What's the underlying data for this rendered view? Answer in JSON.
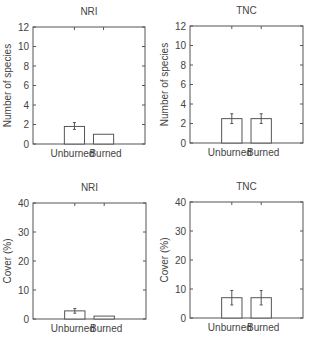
{
  "chart_data": [
    {
      "type": "bar",
      "title": "NRI",
      "xlabel": "",
      "ylabel": "Number of species",
      "categories": [
        "Unburned",
        "Burned"
      ],
      "values": [
        1.8,
        1.0
      ],
      "error_low": [
        1.5,
        null
      ],
      "error_high": [
        2.2,
        null
      ],
      "ylim": [
        0,
        12
      ],
      "yticks": [
        0,
        2,
        4,
        6,
        8,
        10,
        12
      ],
      "grid": false
    },
    {
      "type": "bar",
      "title": "TNC",
      "xlabel": "",
      "ylabel": "Number of species",
      "categories": [
        "Unburned",
        "Burned"
      ],
      "values": [
        2.5,
        2.5
      ],
      "error_low": [
        2.0,
        2.0
      ],
      "error_high": [
        3.0,
        3.0
      ],
      "ylim": [
        0,
        12
      ],
      "yticks": [
        0,
        2,
        4,
        6,
        8,
        10,
        12
      ],
      "grid": false
    },
    {
      "type": "bar",
      "title": "NRI",
      "xlabel": "",
      "ylabel": "Cover (%)",
      "categories": [
        "Unburned",
        "Burned"
      ],
      "values": [
        2.8,
        1.0
      ],
      "error_low": [
        2.0,
        null
      ],
      "error_high": [
        3.6,
        null
      ],
      "ylim": [
        0,
        40
      ],
      "yticks": [
        0,
        10,
        20,
        30,
        40
      ],
      "grid": false
    },
    {
      "type": "bar",
      "title": "TNC",
      "xlabel": "",
      "ylabel": "Cover (%)",
      "categories": [
        "Unburned",
        "Burned"
      ],
      "values": [
        7.0,
        7.0
      ],
      "error_low": [
        4.5,
        4.5
      ],
      "error_high": [
        9.5,
        9.5
      ],
      "ylim": [
        0,
        40
      ],
      "yticks": [
        0,
        10,
        20,
        30,
        40
      ],
      "grid": false
    }
  ],
  "layout": {
    "panels": [
      {
        "x0": 33,
        "x1": 145,
        "y_top": 27,
        "y_bottom": 144
      },
      {
        "x0": 190,
        "x1": 303,
        "y_top": 26,
        "y_bottom": 143
      },
      {
        "x0": 33,
        "x1": 146,
        "y_top": 203,
        "y_bottom": 319
      },
      {
        "x0": 190,
        "x1": 303,
        "y_top": 202,
        "y_bottom": 318
      }
    ],
    "bar_color": "#ffffff",
    "line_color": "#555555"
  }
}
